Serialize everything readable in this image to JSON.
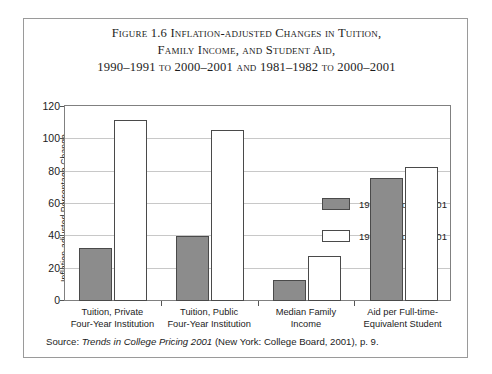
{
  "figure": {
    "title_line1": "Figure 1.6  Inflation-adjusted Changes in Tuition,",
    "title_line2": "Family Income, and Student Aid,",
    "title_line3": "1990–1991 to 2000–2001 and 1981–1982 to 2000–2001",
    "source_prefix": "Source: ",
    "source_italic": "Trends in College Pricing 2001",
    "source_rest": " (New York: College Board, 2001), p. 9."
  },
  "legend": {
    "position": "inside-top-right",
    "items": [
      {
        "label": "1990–91 to 2000–01",
        "swatch": "gray",
        "color": "#8c8c8c"
      },
      {
        "label": "1981–82 to 2000–01",
        "swatch": "white",
        "color": "#ffffff"
      }
    ]
  },
  "chart_data": {
    "type": "bar",
    "title": "Figure 1.6  Inflation-adjusted Changes in Tuition, Family Income, and Student Aid, 1990–1991 to 2000–2001 and 1981–1982 to 2000–2001",
    "xlabel": "",
    "ylabel": "Inflation-adjusted Percentage Change",
    "ylim": [
      0,
      120
    ],
    "yticks": [
      0,
      20,
      40,
      60,
      80,
      100,
      120
    ],
    "ytick_labels": [
      "0",
      "20",
      "40",
      "60",
      "80",
      "100",
      "120"
    ],
    "grid": true,
    "grid_axis": "y",
    "legend_position": "upper right inside plot",
    "categories": [
      "Tuition, Private Four-Year Institution",
      "Tuition, Public Four-Year Institution",
      "Median Family Income",
      "Aid per Full-time-Equivalent Student"
    ],
    "category_lines": [
      [
        "Tuition, Private",
        "Four-Year Institution"
      ],
      [
        "Tuition, Public",
        "Four-Year Institution"
      ],
      [
        "Median Family",
        "Income"
      ],
      [
        "Aid per Full-time-",
        "Equivalent Student"
      ]
    ],
    "series": [
      {
        "name": "1990–91 to 2000–01",
        "color": "#8c8c8c",
        "values": [
          33,
          40,
          13,
          76
        ]
      },
      {
        "name": "1981–82 to 2000–01",
        "color": "#ffffff",
        "values": [
          112,
          106,
          28,
          83
        ]
      }
    ]
  }
}
